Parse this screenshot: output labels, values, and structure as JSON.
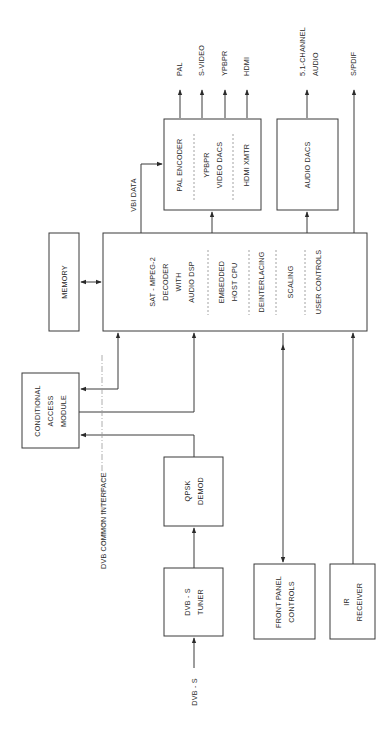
{
  "diagram": {
    "orientation": "rotated-90-ccw",
    "blocks": {
      "decoder": {
        "lines": [
          "SAT - MPEG-2",
          "DECODER",
          "WITH",
          "AUDIO DSP"
        ]
      },
      "host_cpu": {
        "lines": [
          "EMBEDDED",
          "HOST CPU"
        ]
      },
      "deinterlacing": {
        "label": "DEINTERLACING"
      },
      "scaling": {
        "label": "SCALING"
      },
      "user_controls": {
        "label": "USER CONTROLS"
      },
      "memory": {
        "label": "MEMORY"
      },
      "cam": {
        "lines": [
          "CONDITIONAL",
          "ACCESS",
          "MODULE"
        ]
      },
      "qpsk": {
        "lines": [
          "QPSK",
          "DEMOD"
        ]
      },
      "tuner": {
        "lines": [
          "DVB - S",
          "TUNER"
        ]
      },
      "front_panel": {
        "lines": [
          "FRONT PANEL",
          "CONTROLS"
        ]
      },
      "ir": {
        "lines": [
          "IR",
          "RECEIVER"
        ]
      },
      "pal_encoder": {
        "label": "PAL ENCODER"
      },
      "video_dacs": {
        "lines": [
          "YPBPR",
          "VIDEO DACS"
        ]
      },
      "hdmi_xmtr": {
        "label": "HDMI XMTR"
      },
      "audio_dacs": {
        "label": "AUDIO DACS"
      }
    },
    "signals": {
      "vbi": "VBI DATA",
      "common_interface": "DVB COMMON INTERFACE",
      "input": "DVB - S"
    },
    "outputs": {
      "pal": "PAL",
      "svideo": "S-VIDEO",
      "ypbpr": "YPBPR",
      "hdmi": "HDMI",
      "audio51": [
        "5.1-CHANNEL",
        "AUDIO"
      ],
      "spdif": "S/PDIF"
    }
  }
}
